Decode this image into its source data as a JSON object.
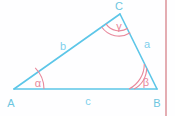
{
  "figure": {
    "type": "geometry-diagram",
    "background_color": "#fefeff",
    "triangle_color": "#5CC6E8",
    "angle_color": "#E8899C",
    "vertex_label_color": "#6CC6E0",
    "side_label_color": "#7FD0EC",
    "margin_line_color": "#D98A92"
  },
  "vertices": [
    {
      "name": "A",
      "label": "A",
      "x": 14,
      "y": 89,
      "label_x": 11,
      "label_y": 103
    },
    {
      "name": "B",
      "label": "B",
      "x": 157,
      "y": 89,
      "label_x": 153,
      "label_y": 103
    },
    {
      "name": "C",
      "label": "C",
      "x": 120,
      "y": 14,
      "label_x": 117,
      "label_y": 10
    }
  ],
  "sides": [
    {
      "name": "a",
      "label": "a",
      "from": "B",
      "to": "C",
      "label_x": 145,
      "label_y": 48
    },
    {
      "name": "b",
      "label": "b",
      "from": "A",
      "to": "C",
      "label_x": 62,
      "label_y": 48
    },
    {
      "name": "c",
      "label": "c",
      "from": "A",
      "to": "B",
      "label_x": 87,
      "label_y": 102
    }
  ],
  "angles": [
    {
      "name": "alpha",
      "label": "α",
      "at_vertex": "A",
      "arcs": 1,
      "label_x": 37,
      "label_y": 85
    },
    {
      "name": "beta",
      "label": "β",
      "at_vertex": "B",
      "arcs": 2,
      "label_x": 145,
      "label_y": 85
    },
    {
      "name": "gamma",
      "label": "γ",
      "at_vertex": "C",
      "arcs": 2,
      "label_x": 120,
      "label_y": 29
    }
  ],
  "margin_line": {
    "label": "right-margin-rule",
    "x": 166,
    "y_top": 0,
    "y_bottom": 116
  }
}
